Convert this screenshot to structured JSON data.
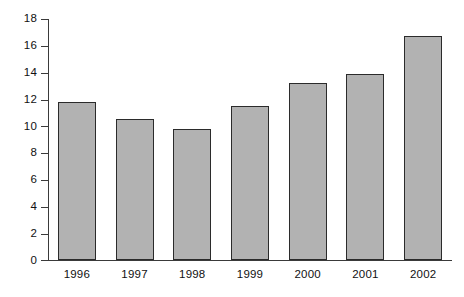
{
  "chart_data": {
    "type": "bar",
    "title": "",
    "subtitle": "",
    "xlabel": "",
    "ylabel": "",
    "categories": [
      "1996",
      "1997",
      "1998",
      "1999",
      "2000",
      "2001",
      "2002"
    ],
    "values": [
      11.8,
      10.5,
      9.8,
      11.5,
      13.2,
      13.9,
      16.7
    ],
    "series": [
      {
        "name": "",
        "values": [
          11.8,
          10.5,
          9.8,
          11.5,
          13.2,
          13.9,
          16.7
        ]
      }
    ],
    "ylim": [
      0,
      18
    ],
    "xlim": [
      0,
      7
    ],
    "y_ticks": [
      0,
      2,
      4,
      6,
      8,
      10,
      12,
      14,
      16,
      18
    ],
    "y_tick_labels": [
      "0",
      "2",
      "4",
      "6",
      "8",
      "10",
      "12",
      "14",
      "16",
      "18"
    ],
    "x_tick_labels": [
      "1996",
      "1997",
      "1998",
      "1999",
      "2000",
      "2001",
      "2002"
    ],
    "grid": false,
    "legend": false,
    "legend_position": "none",
    "annotations": [],
    "colors": {
      "bar_fill": "#b2b2b2",
      "bar_border": "#2b2b2b",
      "axis": "#3a3a3a",
      "text": "#111111",
      "background": "#ffffff"
    }
  }
}
